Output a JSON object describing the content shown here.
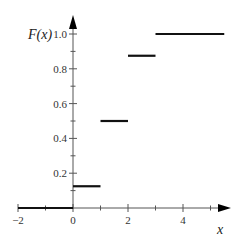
{
  "chart_data": {
    "type": "line",
    "subtype": "step",
    "title": "",
    "xlabel": "x",
    "ylabel": "F(x)",
    "xlim": [
      -2,
      5.5
    ],
    "ylim": [
      0,
      1.0
    ],
    "grid": false,
    "legend": null,
    "x_ticks": [
      -2,
      -1,
      0,
      1,
      2,
      3,
      4,
      5
    ],
    "x_tick_labels": [
      "−2",
      "0",
      "2",
      "4"
    ],
    "x_tick_label_values": [
      -2,
      0,
      2,
      4
    ],
    "y_ticks": [
      0.1,
      0.2,
      0.3,
      0.4,
      0.5,
      0.6,
      0.7,
      0.8,
      0.9,
      1.0
    ],
    "y_tick_labels": [
      "0.2",
      "0.4",
      "0.6",
      "0.8",
      "1.0"
    ],
    "y_tick_label_values": [
      0.2,
      0.4,
      0.6,
      0.8,
      1.0
    ],
    "segments": [
      {
        "x_start": -2,
        "x_end": 0,
        "y": 0
      },
      {
        "x_start": 0,
        "x_end": 1,
        "y": 0.125
      },
      {
        "x_start": 1,
        "x_end": 2,
        "y": 0.5
      },
      {
        "x_start": 2,
        "x_end": 3,
        "y": 0.875
      },
      {
        "x_start": 3,
        "x_end": 5.5,
        "y": 1.0
      }
    ]
  },
  "labels": {
    "x_axis_title": "x",
    "y_axis_title": "F(x)"
  },
  "colors": {
    "line": "#111111",
    "axis": "#555555",
    "text": "#333333"
  }
}
